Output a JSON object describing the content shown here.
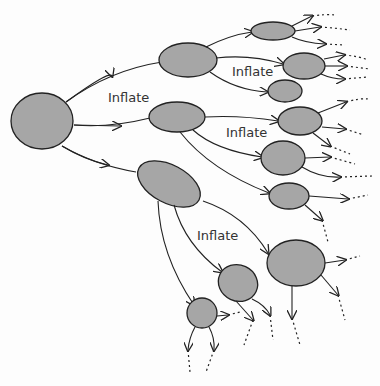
{
  "diagram": {
    "labels": [
      {
        "text": "Inflate",
        "x": 108,
        "y": 90
      },
      {
        "text": "Inflate",
        "x": 232,
        "y": 64
      },
      {
        "text": "Inflate",
        "x": 226,
        "y": 125
      },
      {
        "text": "Inflate",
        "x": 197,
        "y": 228
      }
    ],
    "colors": {
      "bubble_fill": "#a6a6a6",
      "stroke": "#222222",
      "background": "#fdfdfd"
    }
  }
}
